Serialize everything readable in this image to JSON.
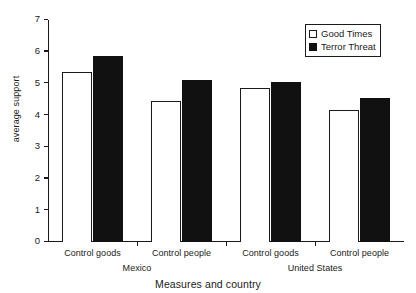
{
  "chart_data": {
    "type": "bar",
    "title": "",
    "xlabel": "Measures and country",
    "ylabel": "average support",
    "ylim": [
      0,
      7
    ],
    "yticks": [
      0,
      1,
      2,
      3,
      4,
      5,
      6,
      7
    ],
    "ytick_labels": [
      "0",
      "1",
      "2",
      "3",
      "4",
      "5",
      "6",
      "7"
    ],
    "grid": false,
    "legend_position": "top-right",
    "categories": [
      "Control goods",
      "Control people",
      "Control goods",
      "Control people"
    ],
    "groups": [
      {
        "label": "Mexico",
        "categories": [
          "Control goods",
          "Control people"
        ]
      },
      {
        "label": "United States",
        "categories": [
          "Control goods",
          "Control people"
        ]
      }
    ],
    "series": [
      {
        "name": "Good Times",
        "color": "#ffffff",
        "edge": "#1a1a1a",
        "values": [
          5.35,
          4.45,
          4.85,
          4.15
        ]
      },
      {
        "name": "Terror Threat",
        "color": "#111111",
        "edge": "#111111",
        "values": [
          5.85,
          5.1,
          5.05,
          4.55
        ]
      }
    ]
  },
  "legend": {
    "items": [
      {
        "label": "Good Times",
        "swatch": "open-square-icon"
      },
      {
        "label": "Terror Threat",
        "swatch": "filled-square-icon"
      }
    ]
  },
  "axes": {
    "y_title": "average support",
    "x_title": "Measures and country"
  }
}
